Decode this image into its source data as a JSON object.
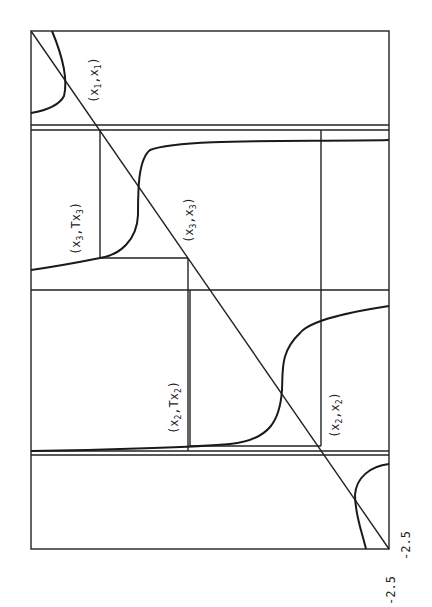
{
  "figure": {
    "orientation": "rotated 90 degrees (page landscape)",
    "axis_labels": {
      "x_min": "-2.5",
      "y_min": "-2.5"
    },
    "points": [
      {
        "id": "x1x1",
        "label": "(x1,x1)",
        "base": "x",
        "sub1": "1",
        "mid": ",x",
        "sub2": "1"
      },
      {
        "id": "x3Tx3",
        "label": "(x3,Tx3)",
        "base": "x",
        "sub1": "3",
        "mid": ",Tx",
        "sub2": "3"
      },
      {
        "id": "x3x3",
        "label": "(x3,x3)",
        "base": "x",
        "sub1": "3",
        "mid": ",x",
        "sub2": "3"
      },
      {
        "id": "x2Tx2",
        "label": "(x2,Tx2)",
        "base": "x",
        "sub1": "2",
        "mid": ",Tx",
        "sub2": "2"
      },
      {
        "id": "x2x2",
        "label": "(x2,x2)",
        "base": "x",
        "sub1": "2",
        "mid": ",x",
        "sub2": "2"
      }
    ]
  }
}
